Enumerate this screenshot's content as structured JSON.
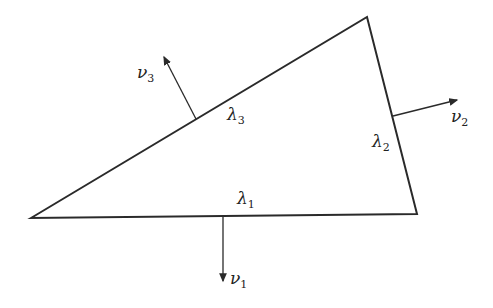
{
  "diagram": {
    "stroke_color": "#2a2a2a",
    "vertices": [
      {
        "name": "left",
        "x": 31,
        "y": 218
      },
      {
        "name": "top",
        "x": 367,
        "y": 17
      },
      {
        "name": "right",
        "x": 417,
        "y": 214
      }
    ],
    "edges": [
      {
        "id": "lambda1",
        "label": "λ",
        "sub": "1"
      },
      {
        "id": "lambda2",
        "label": "λ",
        "sub": "2"
      },
      {
        "id": "lambda3",
        "label": "λ",
        "sub": "3"
      }
    ],
    "normals": [
      {
        "id": "nu1",
        "label": "ν",
        "sub": "1",
        "from": [
          223,
          217
        ],
        "to": [
          223,
          282
        ]
      },
      {
        "id": "nu2",
        "label": "ν",
        "sub": "2",
        "from": [
          393,
          116
        ],
        "to": [
          458,
          100
        ]
      },
      {
        "id": "nu3",
        "label": "ν",
        "sub": "3",
        "from": [
          196,
          119
        ],
        "to": [
          163,
          56
        ]
      }
    ]
  }
}
